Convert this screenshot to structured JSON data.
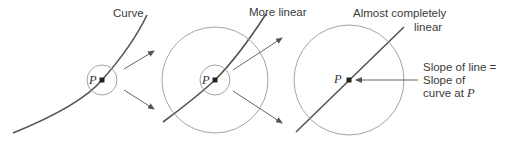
{
  "diagram": {
    "type": "zoom-in linearization illustration",
    "panels": [
      {
        "id": "panel-1",
        "label": "Curve",
        "point_label": "P"
      },
      {
        "id": "panel-2",
        "label": "More linear",
        "point_label": "P"
      },
      {
        "id": "panel-3",
        "label_line1": "Almost completely",
        "label_line2": "linear",
        "point_label": "P"
      }
    ],
    "annotation": {
      "line1": "Slope of line =",
      "line2": "Slope of",
      "line3_prefix": "curve at ",
      "line3_var": "P"
    },
    "colors": {
      "curve": "#555555",
      "circle": "#9a9a9a",
      "arrow": "#555555",
      "point": "#222222",
      "text": "#3a3a3a"
    }
  }
}
